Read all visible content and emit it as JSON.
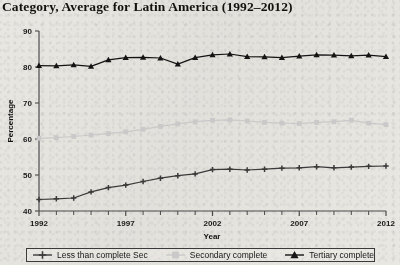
{
  "chart_data": {
    "type": "line",
    "title": "Category, Average for Latin America (1992–2012)",
    "xlabel": "Year",
    "ylabel": "Percentage",
    "ylim": [
      40,
      90
    ],
    "xlim": [
      1992,
      2012
    ],
    "ytick_labels": [
      "40",
      "50",
      "60",
      "70",
      "80",
      "90"
    ],
    "yticks": [
      40,
      50,
      60,
      70,
      80,
      90
    ],
    "xtick_labels": [
      "1992",
      "1997",
      "2002",
      "2007",
      "2012"
    ],
    "xticks": [
      1992,
      1997,
      2002,
      2007,
      2012
    ],
    "x": [
      1992,
      1993,
      1994,
      1995,
      1996,
      1997,
      1998,
      1999,
      2000,
      2001,
      2002,
      2003,
      2004,
      2005,
      2006,
      2007,
      2008,
      2009,
      2010,
      2011,
      2012
    ],
    "grid": false,
    "legend_position": "bottom",
    "series": [
      {
        "name": "Less than complete Sec",
        "marker": "plus",
        "color": "#3a3a3a",
        "values": [
          43.2,
          43.4,
          43.6,
          45.3,
          46.5,
          47.2,
          48.2,
          49.1,
          49.8,
          50.3,
          51.5,
          51.6,
          51.4,
          51.6,
          51.9,
          52.0,
          52.3,
          52.0,
          52.2,
          52.4,
          52.5
        ]
      },
      {
        "name": "Secondary complete",
        "marker": "square",
        "color": "#c9c9c9",
        "values": [
          60.2,
          60.4,
          60.7,
          61.1,
          61.5,
          62.0,
          62.7,
          63.5,
          64.2,
          64.8,
          65.2,
          65.3,
          65.0,
          64.6,
          64.4,
          64.3,
          64.6,
          64.8,
          65.2,
          64.4,
          64.0
        ]
      },
      {
        "name": "Tertiary complete",
        "marker": "triangle",
        "color": "#141414",
        "values": [
          80.4,
          80.3,
          80.6,
          80.2,
          82.0,
          82.6,
          82.7,
          82.5,
          80.8,
          82.6,
          83.4,
          83.6,
          82.9,
          82.8,
          82.6,
          83.0,
          83.4,
          83.3,
          83.1,
          83.3,
          82.9
        ]
      }
    ]
  },
  "legend": {
    "items": [
      {
        "label": "Less than complete Sec",
        "marker": "plus",
        "color": "#3a3a3a"
      },
      {
        "label": "Secondary complete",
        "marker": "square",
        "color": "#c9c9c9"
      },
      {
        "label": "Tertiary complete",
        "marker": "triangle",
        "color": "#141414"
      }
    ]
  }
}
